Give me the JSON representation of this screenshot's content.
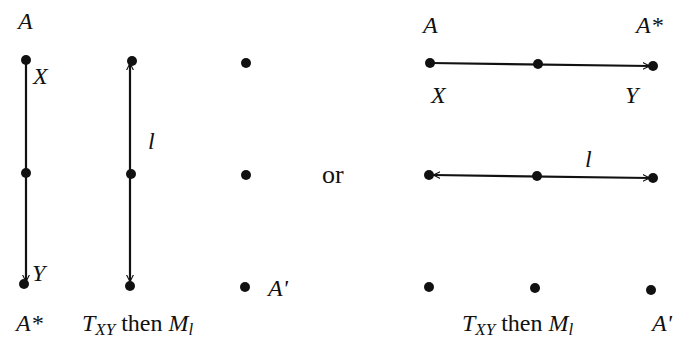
{
  "diagram": {
    "left_figure": {
      "point_labels": {
        "top_left": "A",
        "x_label": "X",
        "y_label": "Y",
        "bottom_left": "A*",
        "line_label": "l",
        "image_label": "A'"
      },
      "caption": {
        "t_main": "T",
        "t_sub": "XY",
        "then": " then ",
        "m_main": "M",
        "m_sub": "l"
      },
      "orientation": "vertical"
    },
    "separator": "or",
    "right_figure": {
      "point_labels": {
        "top_left": "A",
        "top_right": "A*",
        "x_label": "X",
        "y_label": "Y",
        "line_label": "l",
        "image_label": "A'"
      },
      "caption": {
        "t_main": "T",
        "t_sub": "XY",
        "then": " then ",
        "m_main": "M",
        "m_sub": "l"
      },
      "orientation": "horizontal"
    },
    "colors": {
      "ink": "#111111",
      "background": "#ffffff"
    }
  }
}
